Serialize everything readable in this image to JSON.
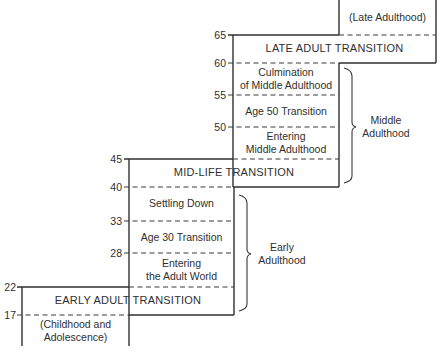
{
  "diagram": {
    "ages": {
      "a65": "65",
      "a60": "60",
      "a55": "55",
      "a50": "50",
      "a45": "45",
      "a40": "40",
      "a33": "33",
      "a28": "28",
      "a22": "22",
      "a17": "17"
    },
    "periods": {
      "late_adulthood": "(Late Adulthood)",
      "late_adult_transition": "LATE ADULT TRANSITION",
      "culmination_line1": "Culmination",
      "culmination_line2": "of Middle Adulthood",
      "age50_transition": "Age 50 Transition",
      "entering_middle_line1": "Entering",
      "entering_middle_line2": "Middle Adulthood",
      "mid_life_transition": "MID-LIFE TRANSITION",
      "settling_down": "Settling Down",
      "age30_transition": "Age 30 Transition",
      "entering_adult_line1": "Entering",
      "entering_adult_line2": "the Adult World",
      "early_adult_transition": "EARLY ADULT TRANSITION",
      "childhood_line1": "(Childhood and",
      "childhood_line2": "Adolescence)"
    },
    "eras": {
      "middle_line1": "Middle",
      "middle_line2": "Adulthood",
      "early_line1": "Early",
      "early_line2": "Adulthood"
    }
  }
}
